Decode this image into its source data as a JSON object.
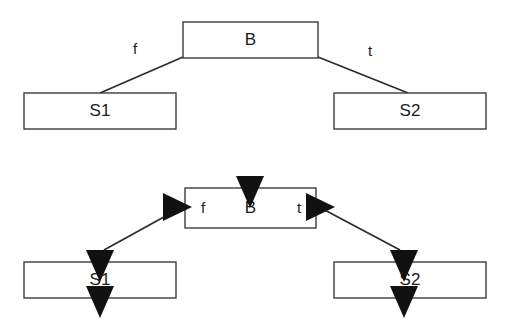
{
  "figure": {
    "type": "diagram",
    "background": "#ffffff",
    "stroke_color": "#3c3c3c",
    "line_color": "#2b2b2b",
    "arrow_color": "#111111",
    "text_color": "#1a1a1a"
  },
  "panels": [
    {
      "id": "upper",
      "name": "upper-panel",
      "nodes": [
        {
          "id": "b",
          "label": "B",
          "x": 183,
          "y": 22,
          "w": 135,
          "h": 36
        },
        {
          "id": "s1",
          "label": "S1",
          "x": 24,
          "y": 93,
          "w": 152,
          "h": 36
        },
        {
          "id": "s2",
          "label": "S2",
          "x": 334,
          "y": 93,
          "w": 152,
          "h": 36
        }
      ],
      "edges": [
        {
          "id": "b-s1",
          "from": "b",
          "to": "s1",
          "label": "f",
          "x1": 183,
          "y1": 57,
          "x2": 100,
          "y2": 93,
          "label_x": 135,
          "label_y": 50
        },
        {
          "id": "b-s2",
          "from": "b",
          "to": "s2",
          "label": "t",
          "x1": 318,
          "y1": 57,
          "x2": 408,
          "y2": 93,
          "label_x": 370,
          "label_y": 52
        }
      ],
      "arrowheads": []
    },
    {
      "id": "lower",
      "name": "lower-panel",
      "nodes": [
        {
          "id": "b",
          "label": "B",
          "x": 185,
          "y": 188,
          "w": 131,
          "h": 40
        },
        {
          "id": "s1",
          "label": "S1",
          "x": 24,
          "y": 262,
          "w": 152,
          "h": 36
        },
        {
          "id": "s2",
          "label": "S2",
          "x": 334,
          "y": 262,
          "w": 152,
          "h": 36
        }
      ],
      "inline_labels": [
        {
          "id": "b-f",
          "label": "f",
          "x": 203,
          "y": 208
        },
        {
          "id": "b-t",
          "label": "t",
          "x": 299,
          "y": 208
        }
      ],
      "edges": [
        {
          "id": "b-s1",
          "from": "b",
          "to": "s1",
          "x1": 182,
          "y1": 207,
          "x2": 104,
          "y2": 250
        },
        {
          "id": "b-s2",
          "from": "b",
          "to": "s2",
          "x1": 319,
          "y1": 207,
          "x2": 400,
          "y2": 250
        }
      ],
      "arrowheads": [
        {
          "id": "b-entry",
          "direction": "down",
          "x": 250,
          "y": 188,
          "note": "entry into B, straddles top edge"
        },
        {
          "id": "b-left",
          "direction": "right",
          "x": 185,
          "y": 207,
          "note": "incoming at B left edge"
        },
        {
          "id": "b-right",
          "direction": "right",
          "x": 316,
          "y": 207,
          "note": "outgoing at B right edge"
        },
        {
          "id": "s1-entry",
          "direction": "down",
          "x": 100,
          "y": 262,
          "note": "entry into S1, straddles top edge"
        },
        {
          "id": "s1-exit",
          "direction": "down",
          "x": 100,
          "y": 298,
          "note": "exit from S1, straddles bottom edge"
        },
        {
          "id": "s2-entry",
          "direction": "down",
          "x": 404,
          "y": 262,
          "note": "entry into S2, straddles top edge"
        },
        {
          "id": "s2-exit",
          "direction": "down",
          "x": 404,
          "y": 298,
          "note": "exit from S2, straddles bottom edge"
        }
      ]
    }
  ],
  "legend": {
    "f_meaning": "f",
    "t_meaning": "t",
    "branch_node": "B",
    "false_branch_node": "S1",
    "true_branch_node": "S2"
  }
}
